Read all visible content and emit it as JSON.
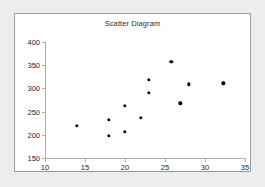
{
  "chart_data": {
    "type": "scatter",
    "title": "Scatter Diagram",
    "xlabel": "",
    "ylabel": "",
    "xlim": [
      10,
      35
    ],
    "ylim": [
      150,
      400
    ],
    "xticks": [
      10,
      15,
      20,
      25,
      30,
      35
    ],
    "yticks": [
      150,
      200,
      250,
      300,
      350,
      400
    ],
    "grid": false,
    "legend": null,
    "marker": "filled-circle",
    "marker_color": "#000000",
    "points": [
      {
        "x": 14.0,
        "y": 219
      },
      {
        "x": 18.0,
        "y": 232
      },
      {
        "x": 18.0,
        "y": 198
      },
      {
        "x": 20.0,
        "y": 263
      },
      {
        "x": 20.0,
        "y": 207
      },
      {
        "x": 22.0,
        "y": 237
      },
      {
        "x": 23.0,
        "y": 318
      },
      {
        "x": 23.0,
        "y": 290
      },
      {
        "x": 25.8,
        "y": 357
      },
      {
        "x": 26.9,
        "y": 268
      },
      {
        "x": 28.0,
        "y": 309
      },
      {
        "x": 32.3,
        "y": 311
      }
    ]
  },
  "colors": {
    "page_background": "#ededed",
    "panel_background": "#ffffff",
    "panel_border": "#9a9a9a",
    "axis": "#aeaeae",
    "text": "#1d1d1d",
    "marker": "#000000"
  }
}
